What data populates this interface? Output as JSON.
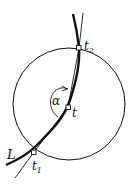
{
  "diagram": {
    "labels": {
      "curve": "L",
      "point_start": "t",
      "point_start_sub": "1",
      "point_end": "t",
      "point_end_sub": "2",
      "point_mid": "t",
      "angle": "α"
    },
    "colors": {
      "stroke": "#111111",
      "background": "#ffffff"
    }
  }
}
